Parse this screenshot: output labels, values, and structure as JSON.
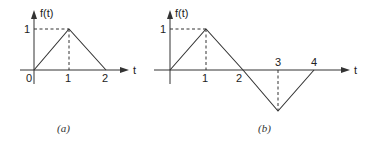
{
  "panels": [
    {
      "id": "a",
      "caption": "(a)",
      "y_axis_label": "f(t)",
      "x_axis_label": "t",
      "origin_label": "0",
      "tick_labels_x": [
        "1",
        "2"
      ],
      "tick_labels_y": [
        "1"
      ],
      "points": [
        [
          0,
          0
        ],
        [
          1,
          1
        ],
        [
          2,
          0
        ]
      ]
    },
    {
      "id": "b",
      "caption": "(b)",
      "y_axis_label": "f(t)",
      "x_axis_label": "t",
      "tick_labels_x": [
        "1",
        "2",
        "3",
        "4"
      ],
      "tick_labels_y": [
        "1"
      ],
      "points": [
        [
          0,
          0
        ],
        [
          1,
          1
        ],
        [
          2,
          0
        ],
        [
          3,
          -1
        ],
        [
          4,
          0
        ]
      ]
    }
  ]
}
